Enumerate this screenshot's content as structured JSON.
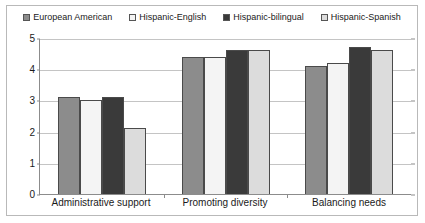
{
  "chart_data": {
    "type": "bar",
    "title": "",
    "xlabel": "",
    "ylabel": "",
    "ylim": [
      0,
      5
    ],
    "yticks": [
      0,
      1,
      2,
      3,
      4,
      5
    ],
    "grid": true,
    "legend_position": "top",
    "categories": [
      "Administrative support",
      "Promoting diversity",
      "Balancing needs"
    ],
    "series": [
      {
        "name": "European American",
        "color": "#8c8c8c",
        "swatch": "gray-filled-swatch",
        "values": [
          3.1,
          4.4,
          4.1
        ]
      },
      {
        "name": "Hispanic-English",
        "color": "#f4f4f4",
        "swatch": "white-empty-swatch",
        "values": [
          3.0,
          4.4,
          4.2
        ]
      },
      {
        "name": "Hispanic-bilingual",
        "color": "#3a3a3a",
        "swatch": "black-filled-swatch",
        "values": [
          3.1,
          4.6,
          4.7
        ]
      },
      {
        "name": "Hispanic-Spanish",
        "color": "#dcdcdc",
        "swatch": "light-gray-swatch",
        "values": [
          2.1,
          4.6,
          4.6
        ]
      }
    ]
  },
  "legend": {
    "items": [
      {
        "label": "European American"
      },
      {
        "label": "Hispanic-English"
      },
      {
        "label": "Hispanic-bilingual"
      },
      {
        "label": "Hispanic-Spanish"
      }
    ]
  },
  "axes": {
    "y_tick_labels": [
      "0",
      "1",
      "2",
      "3",
      "4",
      "5"
    ],
    "x_tick_labels": [
      "Administrative support",
      "Promoting diversity",
      "Balancing needs"
    ]
  },
  "colors": {
    "frame_border": "#b9b9b9",
    "axis": "#8c8c8c",
    "gridline": "#c4c4c4",
    "bar_outline": "#4a4a4a",
    "text": "#1a1a1a"
  }
}
